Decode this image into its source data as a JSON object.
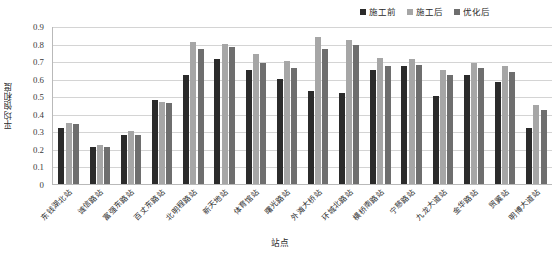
{
  "chart_data": {
    "type": "bar",
    "title": "",
    "xlabel": "站点",
    "ylabel": "平均饱和度",
    "ylim": [
      0,
      0.9
    ],
    "ytick_labels": [
      "0.9",
      "0.8",
      "0.7",
      "0.6",
      "0.5",
      "0.4",
      "0.3",
      "0.2",
      "0.1",
      "0"
    ],
    "ytick_values": [
      0.9,
      0.8,
      0.7,
      0.6,
      0.5,
      0.4,
      0.3,
      0.2,
      0.1,
      0
    ],
    "grid": true,
    "legend_position": "top-right",
    "categories": [
      "东钱湖北站",
      "诚信路站",
      "富强东路站",
      "百丈东路站",
      "北明程路站",
      "新天地站",
      "体育馆站",
      "曙光路站",
      "外滩大桥站",
      "环城北路站",
      "横桥南路站",
      "宁慈路站",
      "九龙大道站",
      "金华路站",
      "贸翼站",
      "明博大道站"
    ],
    "series": [
      {
        "name": "施工前",
        "color": "#2b2b2b",
        "values": [
          0.32,
          0.21,
          0.28,
          0.48,
          0.62,
          0.71,
          0.65,
          0.6,
          0.53,
          0.52,
          0.65,
          0.67,
          0.5,
          0.62,
          0.58,
          0.32
        ]
      },
      {
        "name": "施工后",
        "color": "#a6a6a6",
        "values": [
          0.35,
          0.22,
          0.3,
          0.47,
          0.81,
          0.8,
          0.74,
          0.7,
          0.84,
          0.82,
          0.72,
          0.71,
          0.65,
          0.69,
          0.67,
          0.45
        ]
      },
      {
        "name": "优化后",
        "color": "#6e6e6e",
        "values": [
          0.34,
          0.21,
          0.28,
          0.46,
          0.77,
          0.78,
          0.69,
          0.66,
          0.77,
          0.79,
          0.67,
          0.68,
          0.62,
          0.66,
          0.64,
          0.42
        ]
      }
    ]
  },
  "axis": {
    "y_title": "平均饱和度",
    "x_title": "站点"
  }
}
